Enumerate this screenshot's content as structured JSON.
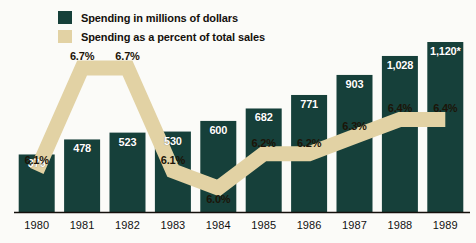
{
  "legend": {
    "items": [
      {
        "label": "Spending in millions of dollars",
        "swatch": "green",
        "color": "#16403a",
        "icon": "legend-swatch-icon"
      },
      {
        "label": "Spending as a percent of total sales",
        "swatch": "tan",
        "color": "#e2d2a4",
        "icon": "legend-swatch-icon"
      }
    ]
  },
  "colors": {
    "bar": "#16403a",
    "band": "#e2d2a4",
    "background": "#fbfbf8",
    "axis": "#14100c",
    "bar_label": "#ffffff",
    "pct_label": "#1c1408",
    "year_label": "#111111"
  },
  "chart_data": {
    "type": "bar",
    "title": "",
    "subtitle": "",
    "xlabel": "",
    "ylabel": "",
    "grid": false,
    "legend_position": "top-left",
    "categories": [
      "1980",
      "1981",
      "1982",
      "1983",
      "1984",
      "1985",
      "1986",
      "1987",
      "1988",
      "1989"
    ],
    "ylim": [
      0,
      1200
    ],
    "series": [
      {
        "name": "Spending in millions of dollars",
        "type": "bar",
        "color": "#16403a",
        "values": [
          379,
          478,
          523,
          530,
          600,
          682,
          771,
          903,
          1028,
          1120
        ],
        "labels": [
          "379",
          "478",
          "523",
          "530",
          "600",
          "682",
          "771",
          "903",
          "1,028",
          "1,120*"
        ]
      },
      {
        "name": "Spending as a percent of total sales",
        "type": "line",
        "color": "#e2d2a4",
        "values": [
          6.1,
          6.7,
          6.7,
          6.1,
          6.0,
          6.2,
          6.2,
          6.3,
          6.4,
          6.4
        ],
        "labels": [
          "6.1%",
          "6.7%",
          "6.7%",
          "6.1%",
          "6.0%",
          "6.2%",
          "6.2%",
          "6.3%",
          "6.4%",
          "6.4%"
        ],
        "y2lim": [
          5.8,
          6.9
        ]
      }
    ],
    "annotations": [
      "* estimated"
    ]
  }
}
